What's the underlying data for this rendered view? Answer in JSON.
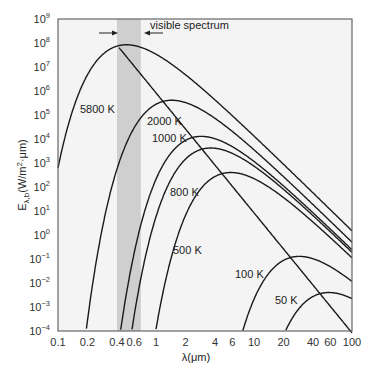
{
  "chart_data": {
    "type": "line",
    "title": "",
    "xlabel": "λ(μm)",
    "ylabel": "E_λ,b(W/m²·μm)",
    "xscale": "log",
    "yscale": "log",
    "xlim": [
      0.1,
      100
    ],
    "ylim": [
      0.0001,
      1000000000.0
    ],
    "grid": false,
    "x_ticks": [
      0.1,
      0.2,
      0.4,
      0.6,
      1,
      2,
      4,
      6,
      10,
      20,
      40,
      60,
      100
    ],
    "x_tick_labels": [
      "0.1",
      "0.2",
      "0.4",
      "0.6",
      "1",
      "2",
      "4",
      "6",
      "10",
      "20",
      "40",
      "60",
      "100"
    ],
    "y_tick_exponents": [
      9,
      8,
      7,
      6,
      5,
      4,
      3,
      2,
      1,
      0,
      -1,
      -2,
      -3,
      -4
    ],
    "series": [
      {
        "name": "5800 K",
        "temperature_K": 5800,
        "peak_wavelength_um": 0.5,
        "peak_value": 83000000.0
      },
      {
        "name": "2000 K",
        "temperature_K": 2000,
        "peak_wavelength_um": 1.45,
        "peak_value": 280000.0
      },
      {
        "name": "1000 K",
        "temperature_K": 1000,
        "peak_wavelength_um": 2.9,
        "peak_value": 11000.0
      },
      {
        "name": "800 K",
        "temperature_K": 800,
        "peak_wavelength_um": 3.6,
        "peak_value": 3400.0
      },
      {
        "name": "500 K",
        "temperature_K": 500,
        "peak_wavelength_um": 5.8,
        "peak_value": 320.0
      },
      {
        "name": "100 K",
        "temperature_K": 100,
        "peak_wavelength_um": 29,
        "peak_value": 0.1
      },
      {
        "name": "50 K",
        "temperature_K": 50,
        "peak_wavelength_um": 58,
        "peak_value": 0.0032
      }
    ],
    "annotations": [
      {
        "text": "visible spectrum",
        "band_um": [
          0.4,
          0.7
        ]
      },
      {
        "text": "Wien displacement locus (λmax·T = 2898 μm·K)",
        "type": "line"
      }
    ]
  },
  "labels": {
    "visible": "visible spectrum",
    "xlabel": "λ(μm)",
    "ylabel_main": "E",
    "ylabel_sub": "λ,b",
    "ylabel_units": "(W/m",
    "ylabel_units_sup": "2",
    "ylabel_units_end": "·μm)",
    "t5800": "5800 K",
    "t2000": "2000 K",
    "t1000": "1000 K",
    "t800": "800 K",
    "t500": "500 K",
    "t100": "100 K",
    "t50": "50 K"
  },
  "colors": {
    "plot_bg": "#f4f4f4",
    "band": "#cfcfcf",
    "curve": "#1a1a1a",
    "frame": "#666666"
  }
}
